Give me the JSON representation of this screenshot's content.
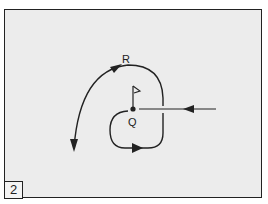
{
  "figure": {
    "panel_number": "2",
    "labels": {
      "R": "R",
      "Q": "Q"
    },
    "colors": {
      "background": "#ececec",
      "stroke": "#222222"
    },
    "elements": [
      {
        "id": "approach-line",
        "description": "straight path coming from the right toward point Q, arrow pointing left"
      },
      {
        "id": "loop-path",
        "description": "path turning down and around Q, arrow pointing right along bottom"
      },
      {
        "id": "arc-path-R",
        "description": "large arc passing near R at top, curving to the lower left, arrow pointing down"
      },
      {
        "id": "flag-Q",
        "description": "flag marker on point Q"
      }
    ]
  }
}
